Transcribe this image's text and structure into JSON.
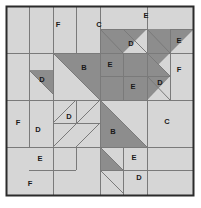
{
  "block": {
    "title": "Quilt Block Piecing Diagram",
    "canvas": {
      "width": 201,
      "height": 208
    },
    "frame": {
      "x": 6,
      "y": 6,
      "width": 188,
      "height": 190
    },
    "grid": {
      "columns": 4,
      "rows": 4,
      "cell_width": 47,
      "cell_height": 47.5
    },
    "colors": {
      "background": "#ffffff",
      "light_fabric": "#d6d6d6",
      "dark_fabric": "#8d8d8d",
      "seam_line": "#7a7a7a",
      "outer_border": "#2b2b2b",
      "label_text": "#1a1a1a"
    }
  },
  "patches": [
    {
      "id": "p01",
      "label": "F",
      "shape": "square",
      "x": 58,
      "y": 25
    },
    {
      "id": "p02",
      "label": "C",
      "shape": "square",
      "x": 99,
      "y": 25
    },
    {
      "id": "p03",
      "label": "E",
      "shape": "square",
      "x": 146,
      "y": 16
    },
    {
      "id": "p04",
      "label": "E",
      "shape": "square",
      "x": 179,
      "y": 41
    },
    {
      "id": "p05",
      "label": "D",
      "shape": "triangle",
      "x": 131,
      "y": 44
    },
    {
      "id": "p06",
      "label": "B",
      "shape": "triangle",
      "x": 84,
      "y": 68
    },
    {
      "id": "p07",
      "label": "E",
      "shape": "square",
      "x": 110,
      "y": 65
    },
    {
      "id": "p08",
      "label": "F",
      "shape": "square",
      "x": 179,
      "y": 70
    },
    {
      "id": "p09",
      "label": "D",
      "shape": "triangle",
      "x": 42,
      "y": 80
    },
    {
      "id": "p10",
      "label": "E",
      "shape": "square",
      "x": 133,
      "y": 87
    },
    {
      "id": "p11",
      "label": "D",
      "shape": "triangle",
      "x": 160,
      "y": 83
    },
    {
      "id": "p12",
      "label": "F",
      "shape": "square",
      "x": 18,
      "y": 123
    },
    {
      "id": "p13",
      "label": "D",
      "shape": "triangle",
      "x": 38,
      "y": 130
    },
    {
      "id": "p14",
      "label": "D",
      "shape": "triangle",
      "x": 69,
      "y": 117
    },
    {
      "id": "p15",
      "label": "B",
      "shape": "triangle",
      "x": 113,
      "y": 132
    },
    {
      "id": "p16",
      "label": "C",
      "shape": "square",
      "x": 167,
      "y": 122
    },
    {
      "id": "p17",
      "label": "E",
      "shape": "square",
      "x": 40,
      "y": 159
    },
    {
      "id": "p18",
      "label": "E",
      "shape": "square",
      "x": 134,
      "y": 158
    },
    {
      "id": "p19",
      "label": "D",
      "shape": "triangle",
      "x": 139,
      "y": 178
    },
    {
      "id": "p20",
      "label": "F",
      "shape": "square",
      "x": 30,
      "y": 184
    }
  ],
  "dark_regions": [
    {
      "id": "d1",
      "name": "top-center-tri-1",
      "points": "100,29 147,29 100,76"
    },
    {
      "id": "d2",
      "name": "top-right-tri-2",
      "points": "147,29 194,29 147,76"
    },
    {
      "id": "d3",
      "name": "center-big-tri",
      "points": "53,53 100,53 100,100"
    },
    {
      "id": "d4",
      "name": "dark-block-left",
      "points": "100,53 123,53 123,100 100,100"
    },
    {
      "id": "d5",
      "name": "dark-block-right",
      "points": "123,53 147,53 147,100 123,100"
    },
    {
      "id": "d6",
      "name": "right-tri-upper",
      "points": "147,53 147,100 170,76"
    },
    {
      "id": "d7",
      "name": "right-tri-lower",
      "points": "147,76 170,76 147,100"
    },
    {
      "id": "d8",
      "name": "left-small-tri",
      "points": "29,70 53,70 53,94"
    },
    {
      "id": "d9",
      "name": "lower-big-tri",
      "points": "100,100 147,147 100,147"
    },
    {
      "id": "d10",
      "name": "lower-tail-tri",
      "points": "100,147 123,170 100,170"
    }
  ],
  "seam_lines": [
    {
      "id": "s1",
      "x1": 53,
      "y1": 6,
      "x2": 53,
      "y2": 196
    },
    {
      "id": "s2",
      "x1": 100,
      "y1": 6,
      "x2": 100,
      "y2": 196
    },
    {
      "id": "s3",
      "x1": 147,
      "y1": 6,
      "x2": 147,
      "y2": 196
    },
    {
      "id": "s4",
      "x1": 6,
      "y1": 53,
      "x2": 194,
      "y2": 53
    },
    {
      "id": "s5",
      "x1": 6,
      "y1": 100,
      "x2": 194,
      "y2": 100
    },
    {
      "id": "s6",
      "x1": 6,
      "y1": 147,
      "x2": 194,
      "y2": 147
    },
    {
      "id": "s7",
      "x1": 29,
      "y1": 6,
      "x2": 29,
      "y2": 53
    },
    {
      "id": "s8",
      "x1": 76,
      "y1": 6,
      "x2": 76,
      "y2": 53
    },
    {
      "id": "s9",
      "x1": 170,
      "y1": 29,
      "x2": 194,
      "y2": 29
    },
    {
      "id": "s10",
      "x1": 123,
      "y1": 29,
      "x2": 147,
      "y2": 29
    },
    {
      "id": "s11",
      "x1": 100,
      "y1": 29,
      "x2": 123,
      "y2": 29
    },
    {
      "id": "s12",
      "x1": 170,
      "y1": 29,
      "x2": 170,
      "y2": 100
    },
    {
      "id": "s13",
      "x1": 123,
      "y1": 53,
      "x2": 123,
      "y2": 100
    },
    {
      "id": "s14",
      "x1": 100,
      "y1": 76,
      "x2": 170,
      "y2": 76
    },
    {
      "id": "s15",
      "x1": 29,
      "y1": 53,
      "x2": 29,
      "y2": 147
    },
    {
      "id": "s16",
      "x1": 53,
      "y1": 123,
      "x2": 100,
      "y2": 123
    },
    {
      "id": "s17",
      "x1": 53,
      "y1": 100,
      "x2": 53,
      "y2": 170
    },
    {
      "id": "s18",
      "x1": 76,
      "y1": 100,
      "x2": 76,
      "y2": 123
    },
    {
      "id": "s19",
      "x1": 29,
      "y1": 170,
      "x2": 76,
      "y2": 170
    },
    {
      "id": "s20",
      "x1": 123,
      "y1": 147,
      "x2": 123,
      "y2": 196
    },
    {
      "id": "s21",
      "x1": 100,
      "y1": 170,
      "x2": 147,
      "y2": 170
    },
    {
      "id": "s22",
      "x1": 147,
      "y1": 170,
      "x2": 194,
      "y2": 170
    },
    {
      "id": "s23",
      "x1": 76,
      "y1": 147,
      "x2": 76,
      "y2": 170
    }
  ],
  "diagonal_lines": [
    {
      "id": "g1",
      "x1": 100,
      "y1": 29,
      "x2": 123,
      "y2": 53
    },
    {
      "id": "g2",
      "x1": 123,
      "y1": 29,
      "x2": 147,
      "y2": 53
    },
    {
      "id": "g3",
      "x1": 147,
      "y1": 29,
      "x2": 170,
      "y2": 53
    },
    {
      "id": "g4",
      "x1": 53,
      "y1": 53,
      "x2": 100,
      "y2": 100
    },
    {
      "id": "g5",
      "x1": 29,
      "y1": 70,
      "x2": 53,
      "y2": 94
    },
    {
      "id": "g6",
      "x1": 147,
      "y1": 53,
      "x2": 170,
      "y2": 76
    },
    {
      "id": "g7",
      "x1": 147,
      "y1": 76,
      "x2": 170,
      "y2": 100
    },
    {
      "id": "g8",
      "x1": 100,
      "y1": 100,
      "x2": 147,
      "y2": 147
    },
    {
      "id": "g9",
      "x1": 100,
      "y1": 147,
      "x2": 123,
      "y2": 170
    },
    {
      "id": "g10",
      "x1": 100,
      "y1": 170,
      "x2": 123,
      "y2": 193
    },
    {
      "id": "g11",
      "x1": 53,
      "y1": 147,
      "x2": 100,
      "y2": 100
    },
    {
      "id": "g12",
      "x1": 53,
      "y1": 123,
      "x2": 76,
      "y2": 100
    },
    {
      "id": "g13",
      "x1": 76,
      "y1": 147,
      "x2": 100,
      "y2": 123
    }
  ]
}
